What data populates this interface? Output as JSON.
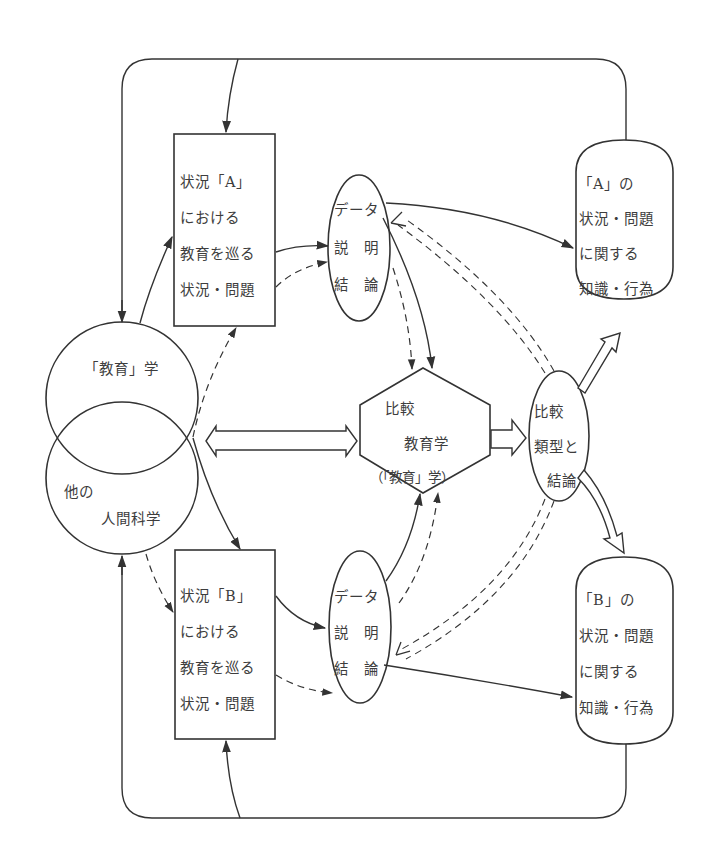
{
  "diagram": {
    "type": "comparative-education-model",
    "nodes": {
      "education_studies": {
        "label": "「教育」学"
      },
      "other_human_sciences": {
        "line1": "他の",
        "line2": "人間科学"
      },
      "situation_a": {
        "lines": [
          "状況「A」",
          "における",
          "教育を巡る",
          "状況・問題"
        ]
      },
      "situation_b": {
        "lines": [
          "状況「B」",
          "における",
          "教育を巡る",
          "状況・問題"
        ]
      },
      "data_a": {
        "lines": [
          "データ",
          "説　明",
          "結　論"
        ]
      },
      "data_b": {
        "lines": [
          "データ",
          "説　明",
          "結　論"
        ]
      },
      "comparative_education": {
        "line1": "比較",
        "line2": "教育学",
        "line3": "（「教育」学）"
      },
      "comparison_typology": {
        "lines": [
          "比較",
          "類型と",
          "結論"
        ]
      },
      "knowledge_a": {
        "lines": [
          "「A」の",
          "状況・問題",
          "に関する",
          "知識・行為"
        ]
      },
      "knowledge_b": {
        "lines": [
          "「B」の",
          "状況・問題",
          "に関する",
          "知識・行為"
        ]
      }
    },
    "colors": {
      "stroke": "#333333",
      "text": "#3d3d3d",
      "background": "#ffffff"
    }
  }
}
